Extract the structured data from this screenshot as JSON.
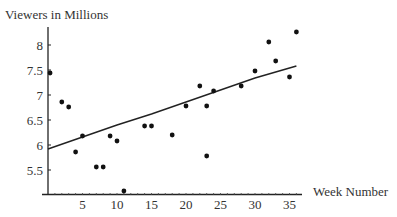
{
  "chart_data": {
    "type": "scatter",
    "title": "",
    "xlabel": "Week Number",
    "ylabel": "Viewers in Millions",
    "xlim": [
      0,
      37
    ],
    "ylim": [
      5,
      8.4
    ],
    "x_ticks": [
      5,
      10,
      15,
      20,
      25,
      30,
      35
    ],
    "y_ticks": [
      5.5,
      6,
      6.5,
      7,
      7.5,
      8
    ],
    "grid": false,
    "legend": "none",
    "series": [
      {
        "name": "Viewers",
        "type": "scatter",
        "points": [
          {
            "x": 0.3,
            "y": 7.44
          },
          {
            "x": 2,
            "y": 6.86
          },
          {
            "x": 3,
            "y": 6.76
          },
          {
            "x": 4,
            "y": 5.86
          },
          {
            "x": 5,
            "y": 6.18
          },
          {
            "x": 7,
            "y": 5.56
          },
          {
            "x": 8,
            "y": 5.56
          },
          {
            "x": 9,
            "y": 6.18
          },
          {
            "x": 10,
            "y": 6.08
          },
          {
            "x": 11,
            "y": 5.08
          },
          {
            "x": 14,
            "y": 6.38
          },
          {
            "x": 15,
            "y": 6.38
          },
          {
            "x": 18,
            "y": 6.2
          },
          {
            "x": 20,
            "y": 6.78
          },
          {
            "x": 22,
            "y": 7.18
          },
          {
            "x": 23,
            "y": 6.78
          },
          {
            "x": 23,
            "y": 5.78
          },
          {
            "x": 24,
            "y": 7.08
          },
          {
            "x": 28,
            "y": 7.18
          },
          {
            "x": 30,
            "y": 7.48
          },
          {
            "x": 32,
            "y": 8.06
          },
          {
            "x": 33,
            "y": 7.68
          },
          {
            "x": 35,
            "y": 7.36
          },
          {
            "x": 36,
            "y": 8.26
          }
        ]
      },
      {
        "name": "Trend line",
        "type": "line",
        "points": [
          {
            "x": 0,
            "y": 5.92
          },
          {
            "x": 5,
            "y": 6.16
          },
          {
            "x": 10,
            "y": 6.4
          },
          {
            "x": 15,
            "y": 6.62
          },
          {
            "x": 20,
            "y": 6.86
          },
          {
            "x": 25,
            "y": 7.1
          },
          {
            "x": 30,
            "y": 7.34
          },
          {
            "x": 36,
            "y": 7.58
          }
        ]
      }
    ]
  }
}
